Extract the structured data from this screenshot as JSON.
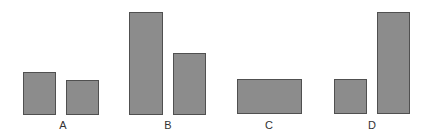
{
  "colors": {
    "bar_fill": "#8c8c8c",
    "bar_border": "#505050",
    "label": "#333333",
    "background": "#ffffff"
  },
  "groups": [
    {
      "label": "A",
      "bars": [
        {
          "height_rel": 0.41
        },
        {
          "height_rel": 0.33
        }
      ]
    },
    {
      "label": "B",
      "bars": [
        {
          "height_rel": 1.0
        },
        {
          "height_rel": 0.6
        }
      ]
    },
    {
      "label": "C",
      "bars": [
        {
          "height_rel": 0.33,
          "wide": true
        }
      ]
    },
    {
      "label": "D",
      "bars": [
        {
          "height_rel": 0.33
        },
        {
          "height_rel": 1.0
        }
      ]
    }
  ]
}
